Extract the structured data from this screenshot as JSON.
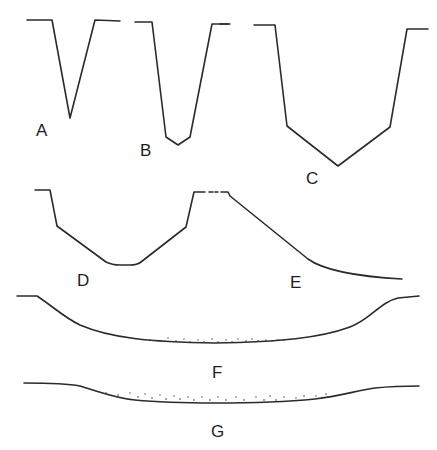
{
  "figure": {
    "stroke_color": "#2b2b2b",
    "background": "#ffffff",
    "profiles": [
      {
        "id": "A",
        "label": "A",
        "shape": "sharp V-shaped valley"
      },
      {
        "id": "B",
        "label": "B",
        "shape": "narrow V-shaped valley with small flat floor"
      },
      {
        "id": "C",
        "label": "C",
        "shape": "wide V with steep walls and angular floor"
      },
      {
        "id": "D",
        "label": "D",
        "shape": "shallow steep-walled valley with rounded floor"
      },
      {
        "id": "E",
        "label": "E",
        "shape": "one-sided sloping profile flattening out"
      },
      {
        "id": "F",
        "label": "F",
        "shape": "broad shallow valley with sediment fill"
      },
      {
        "id": "G",
        "label": "G",
        "shape": "very broad, flat valley with sediment fill"
      }
    ]
  }
}
